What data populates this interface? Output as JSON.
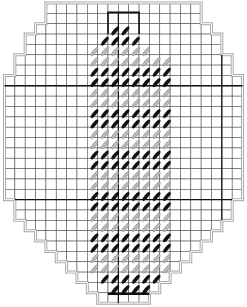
{
  "grid": {
    "cols": 23,
    "rows": 29,
    "outline_rows": [
      [
        4,
        7
      ],
      [
        4,
        7
      ],
      [
        3,
        8
      ],
      [
        2,
        9
      ],
      [
        2,
        9
      ],
      [
        1,
        10
      ],
      [
        1,
        10
      ],
      [
        0,
        11
      ],
      [
        0,
        11
      ],
      [
        0,
        11
      ],
      [
        0,
        11
      ],
      [
        0,
        11
      ],
      [
        0,
        11
      ],
      [
        0,
        11
      ],
      [
        0,
        11
      ],
      [
        0,
        11
      ],
      [
        0,
        11
      ],
      [
        0,
        11
      ],
      [
        0,
        11
      ],
      [
        1,
        10
      ],
      [
        1,
        10
      ],
      [
        2,
        9
      ],
      [
        3,
        8
      ],
      [
        4,
        7
      ],
      [
        5,
        6
      ],
      [
        6,
        5
      ],
      [
        7,
        4
      ],
      [
        8,
        3
      ],
      [
        9,
        2
      ]
    ]
  },
  "colors": {
    "grid_line": "#555555",
    "outline": "#aaaaaa",
    "bold_line": "#111111",
    "stitch_dark": "#111111",
    "stitch_light": "#bbbbbb"
  },
  "stitch_rows": [
    {
      "row": 2,
      "start": 10,
      "end": 11,
      "color": "dark"
    },
    {
      "row": 3,
      "start": 9,
      "end": 12,
      "color": "dark"
    },
    {
      "row": 4,
      "start": 8,
      "end": 13,
      "color": "light"
    },
    {
      "row": 5,
      "start": 8,
      "end": 15,
      "color": "light"
    },
    {
      "row": 6,
      "start": 8,
      "end": 15,
      "color": "dark"
    },
    {
      "row": 7,
      "start": 8,
      "end": 15,
      "color": "dark"
    },
    {
      "row": 8,
      "start": 8,
      "end": 15,
      "color": "light"
    },
    {
      "row": 9,
      "start": 8,
      "end": 15,
      "color": "light"
    },
    {
      "row": 10,
      "start": 8,
      "end": 15,
      "color": "dark"
    },
    {
      "row": 11,
      "start": 8,
      "end": 15,
      "color": "dark"
    },
    {
      "row": 12,
      "start": 8,
      "end": 15,
      "color": "light"
    },
    {
      "row": 13,
      "start": 8,
      "end": 15,
      "color": "light"
    },
    {
      "row": 14,
      "start": 8,
      "end": 15,
      "color": "dark"
    },
    {
      "row": 15,
      "start": 8,
      "end": 15,
      "color": "dark"
    },
    {
      "row": 16,
      "start": 8,
      "end": 15,
      "color": "light"
    },
    {
      "row": 17,
      "start": 8,
      "end": 15,
      "color": "light"
    },
    {
      "row": 18,
      "start": 8,
      "end": 15,
      "color": "dark"
    },
    {
      "row": 19,
      "start": 8,
      "end": 15,
      "color": "dark"
    },
    {
      "row": 20,
      "start": 8,
      "end": 15,
      "color": "light"
    },
    {
      "row": 21,
      "start": 8,
      "end": 15,
      "color": "light"
    },
    {
      "row": 22,
      "start": 8,
      "end": 15,
      "color": "dark"
    },
    {
      "row": 23,
      "start": 8,
      "end": 15,
      "color": "dark"
    },
    {
      "row": 24,
      "start": 8,
      "end": 15,
      "color": "light"
    },
    {
      "row": 25,
      "start": 8,
      "end": 15,
      "color": "light"
    },
    {
      "row": 26,
      "start": 9,
      "end": 14,
      "color": "dark"
    },
    {
      "row": 27,
      "start": 10,
      "end": 13,
      "color": "dark"
    }
  ],
  "bold_lines": {
    "horizontal_rows": [
      8,
      19
    ],
    "vertical_cols": [
      11,
      21
    ],
    "top_box": {
      "row_start": 1,
      "row_end": 3,
      "col_start": 10,
      "col_end": 13
    },
    "bottom_bar": {
      "row": 28,
      "col_start": 10,
      "col_end": 14
    }
  }
}
